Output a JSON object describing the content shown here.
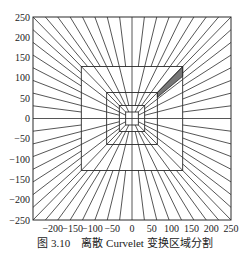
{
  "figure": {
    "caption_number": "图 3.10",
    "caption_text": "离散 Curvelet 变换区域分割",
    "stroke_color": "#2b2b2b",
    "highlight_color": "#777777"
  },
  "chart_data": {
    "type": "diagram",
    "title": "离散 Curvelet 变换区域分割",
    "xlim": [
      -250,
      250
    ],
    "ylim": [
      -250,
      250
    ],
    "xticks": [
      -200,
      -150,
      -100,
      -50,
      0,
      50,
      100,
      150,
      200,
      250
    ],
    "yticks": [
      250,
      200,
      150,
      100,
      50,
      0,
      -50,
      -100,
      -150,
      -200,
      -250
    ],
    "concentric_squares_halfwidth": [
      250,
      128,
      64,
      32,
      16
    ],
    "radial_lines_per_side_outer": 16,
    "highlighted_wedge": "shaded wedge between squares of half-width 64 and 128 in upper-right, near 45°"
  }
}
